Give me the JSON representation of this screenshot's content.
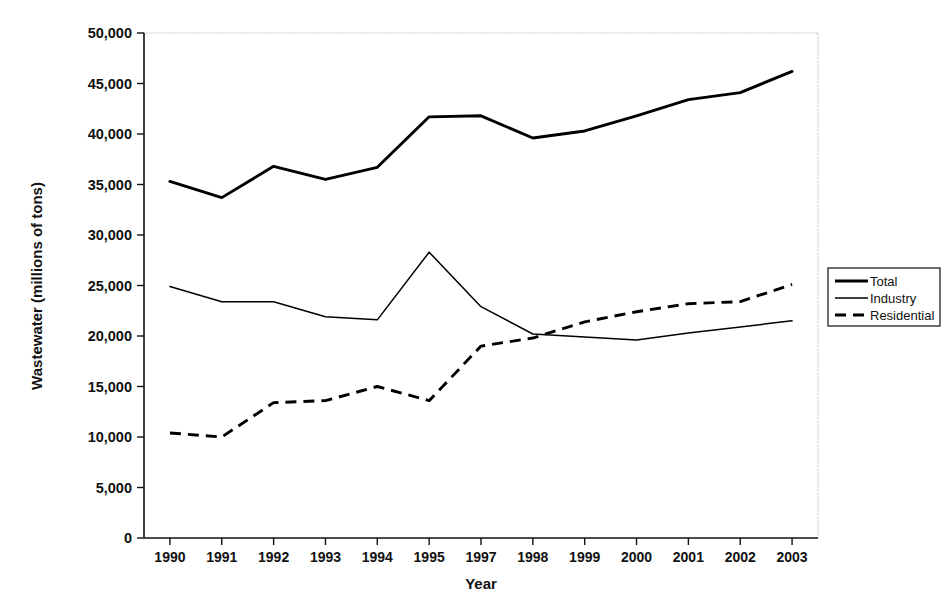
{
  "chart_data": {
    "type": "line",
    "title": "",
    "xlabel": "Year",
    "ylabel": "Wastewater (millions of tons)",
    "categories": [
      "1990",
      "1991",
      "1992",
      "1993",
      "1994",
      "1995",
      "1997",
      "1998",
      "1999",
      "2000",
      "2001",
      "2002",
      "2003"
    ],
    "ylim": [
      0,
      50000
    ],
    "ytick_values": [
      0,
      5000,
      10000,
      15000,
      20000,
      25000,
      30000,
      35000,
      40000,
      45000,
      50000
    ],
    "ytick_labels": [
      "0",
      "5,000",
      "10,000",
      "15,000",
      "20,000",
      "25,000",
      "30,000",
      "35,000",
      "40,000",
      "45,000",
      "50,000"
    ],
    "grid": false,
    "legend_position": "right",
    "series": [
      {
        "name": "Total",
        "style": "solid-thick",
        "values": [
          35300,
          33700,
          36800,
          35500,
          36700,
          41700,
          41800,
          39600,
          40300,
          41800,
          43400,
          44100,
          46200
        ]
      },
      {
        "name": "Industry",
        "style": "solid-thin",
        "values": [
          24900,
          23400,
          23400,
          21900,
          21600,
          28300,
          22900,
          20200,
          19900,
          19600,
          20300,
          20900,
          21500
        ]
      },
      {
        "name": "Residential",
        "style": "dashed",
        "values": [
          10400,
          10000,
          13400,
          13600,
          15000,
          13600,
          19000,
          19800,
          21400,
          22400,
          23200,
          23400,
          25100
        ]
      }
    ]
  },
  "legend": {
    "items": [
      {
        "label": "Total"
      },
      {
        "label": "Industry"
      },
      {
        "label": "Residential"
      }
    ]
  }
}
